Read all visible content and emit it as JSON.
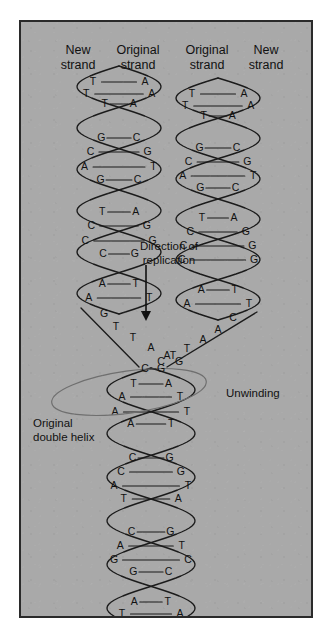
{
  "figure": {
    "panel_background": "#a9a9a9",
    "border_color": "#2a2a2a",
    "ink_color": "#111111",
    "ellipse_color": "#6f6f6f"
  },
  "headers": [
    {
      "id": "new-left",
      "line1": "New",
      "line2": "strand",
      "x": 57,
      "y": 32
    },
    {
      "id": "original-left",
      "line1": "Original",
      "line2": "strand",
      "x": 117,
      "y": 32
    },
    {
      "id": "original-right",
      "line1": "Original",
      "line2": "strand",
      "x": 186,
      "y": 32
    },
    {
      "id": "new-right",
      "line1": "New",
      "line2": "strand",
      "x": 245,
      "y": 32
    }
  ],
  "annotations": [
    {
      "id": "direction-of-replication",
      "line1": "Direction of",
      "line2": "replication",
      "x": 148,
      "y": 228,
      "anchor": "middle"
    },
    {
      "id": "unwinding",
      "line1": "Unwinding",
      "line2": "",
      "x": 205,
      "y": 375,
      "anchor": "start"
    },
    {
      "id": "original-double-helix",
      "line1": "Original",
      "line2": "double helix",
      "x": 12,
      "y": 405,
      "anchor": "start"
    }
  ],
  "arrow": {
    "id": "replication-direction-arrow",
    "x": 125,
    "y_start": 243,
    "y_end": 301
  },
  "unwinding_ellipse": {
    "cx": 108,
    "cy": 370,
    "rx": 78,
    "ry": 21,
    "rotation": -8
  },
  "helix_left": {
    "label": "Left daughter duplex (new strand + original strand)",
    "axis_x": 98,
    "amplitude": 42,
    "rungs": [
      {
        "y": 60,
        "left": "T",
        "right": "A",
        "span": 0.62,
        "tight": false
      },
      {
        "y": 72,
        "left": "T",
        "right": "A",
        "span": 0.78,
        "tight": false
      },
      {
        "y": 82,
        "left": "T",
        "right": "A",
        "span": 0.34,
        "tight": true
      },
      {
        "y": 116,
        "left": "G",
        "right": "C",
        "span": 0.42,
        "tight": true
      },
      {
        "y": 130,
        "left": "C",
        "right": "G",
        "span": 0.68,
        "tight": false
      },
      {
        "y": 145,
        "left": "A",
        "right": "T",
        "span": 0.82,
        "tight": false
      },
      {
        "y": 158,
        "left": "G",
        "right": "C",
        "span": 0.44,
        "tight": true
      },
      {
        "y": 190,
        "left": "T",
        "right": "A",
        "span": 0.4,
        "tight": true
      },
      {
        "y": 204,
        "left": "C",
        "right": "G",
        "span": 0.66,
        "tight": false
      },
      {
        "y": 219,
        "left": "C",
        "right": "G",
        "span": 0.8,
        "tight": false
      },
      {
        "y": 232,
        "left": "C",
        "right": "G",
        "span": 0.38,
        "tight": true
      },
      {
        "y": 262,
        "left": "A",
        "right": "T",
        "span": 0.4,
        "tight": true
      },
      {
        "y": 276,
        "left": "A",
        "right": "T",
        "span": 0.72,
        "tight": false
      }
    ],
    "unwound_bases": [
      {
        "base": "G",
        "x": 83,
        "y": 292
      },
      {
        "base": "T",
        "x": 95,
        "y": 305
      },
      {
        "base": "T",
        "x": 112,
        "y": 316
      },
      {
        "base": "A",
        "x": 130,
        "y": 326
      },
      {
        "base": "A",
        "x": 146,
        "y": 334
      },
      {
        "base": "G",
        "x": 158,
        "y": 340
      }
    ]
  },
  "helix_right": {
    "label": "Right daughter duplex (original strand + new strand)",
    "axis_x": 197,
    "amplitude": 42,
    "rungs": [
      {
        "y": 72,
        "left": "T",
        "right": "A",
        "span": 0.62,
        "tight": false
      },
      {
        "y": 84,
        "left": "T",
        "right": "A",
        "span": 0.78,
        "tight": false
      },
      {
        "y": 94,
        "left": "T",
        "right": "A",
        "span": 0.34,
        "tight": true
      },
      {
        "y": 126,
        "left": "G",
        "right": "C",
        "span": 0.44,
        "tight": true
      },
      {
        "y": 140,
        "left": "C",
        "right": "G",
        "span": 0.7,
        "tight": false
      },
      {
        "y": 154,
        "left": "A",
        "right": "T",
        "span": 0.84,
        "tight": false
      },
      {
        "y": 166,
        "left": "G",
        "right": "C",
        "span": 0.42,
        "tight": true
      },
      {
        "y": 196,
        "left": "T",
        "right": "A",
        "span": 0.38,
        "tight": true
      },
      {
        "y": 210,
        "left": "C",
        "right": "G",
        "span": 0.66,
        "tight": false
      },
      {
        "y": 224,
        "left": "C",
        "right": "G",
        "span": 0.82,
        "tight": false
      },
      {
        "y": 238,
        "left": "C",
        "right": "G",
        "span": 0.86,
        "tight": false
      },
      {
        "y": 268,
        "left": "A",
        "right": "T",
        "span": 0.4,
        "tight": true
      },
      {
        "y": 282,
        "left": "A",
        "right": "T",
        "span": 0.74,
        "tight": false
      }
    ],
    "unwound_bases": [
      {
        "base": "C",
        "x": 212,
        "y": 296
      },
      {
        "base": "A",
        "x": 197,
        "y": 308
      },
      {
        "base": "A",
        "x": 182,
        "y": 318
      },
      {
        "base": "T",
        "x": 166,
        "y": 327
      },
      {
        "base": "T",
        "x": 152,
        "y": 334
      },
      {
        "base": "C",
        "x": 140,
        "y": 340
      }
    ]
  },
  "fork_pair": {
    "label": "Replication fork apex base pair",
    "left": "C",
    "left_x": 124,
    "right": "G",
    "right_x": 140,
    "y": 347
  },
  "helix_parent": {
    "label": "Original (parental) double helix below the fork",
    "axis_x": 130,
    "amplitude": 44,
    "rungs": [
      {
        "y": 362,
        "left": "T",
        "right": "A",
        "span": 0.4,
        "tight": true
      },
      {
        "y": 375,
        "left": "A",
        "right": "T",
        "span": 0.66,
        "tight": false
      },
      {
        "y": 390,
        "left": "A",
        "right": "T",
        "span": 0.82,
        "tight": false
      },
      {
        "y": 402,
        "left": "A",
        "right": "T",
        "span": 0.46,
        "tight": true
      },
      {
        "y": 436,
        "left": "C",
        "right": "G",
        "span": 0.42,
        "tight": true
      },
      {
        "y": 450,
        "left": "C",
        "right": "G",
        "span": 0.68,
        "tight": false
      },
      {
        "y": 464,
        "left": "A",
        "right": "T",
        "span": 0.84,
        "tight": false
      },
      {
        "y": 477,
        "left": "T",
        "right": "A",
        "span": 0.62,
        "tight": false
      },
      {
        "y": 510,
        "left": "C",
        "right": "G",
        "span": 0.44,
        "tight": true
      },
      {
        "y": 524,
        "left": "A",
        "right": "T",
        "span": 0.7,
        "tight": false
      },
      {
        "y": 538,
        "left": "G",
        "right": "C",
        "span": 0.84,
        "tight": false
      },
      {
        "y": 550,
        "left": "G",
        "right": "C",
        "span": 0.4,
        "tight": true
      },
      {
        "y": 580,
        "left": "A",
        "right": "T",
        "span": 0.38,
        "tight": true
      },
      {
        "y": 592,
        "left": "T",
        "right": "A",
        "span": 0.66,
        "tight": false
      }
    ]
  }
}
